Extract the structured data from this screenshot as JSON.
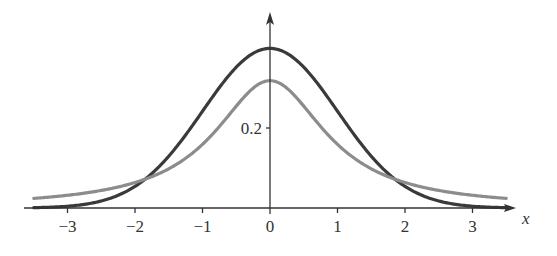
{
  "chart_data": {
    "type": "line",
    "title": "",
    "xlabel": "x",
    "ylabel": "",
    "xlim": [
      -3.5,
      3.5
    ],
    "ylim": [
      0,
      0.42
    ],
    "x_ticks": [
      -3,
      -2,
      -1,
      0,
      1,
      2,
      3
    ],
    "x_tick_labels": [
      "−3",
      "−2",
      "−1",
      "0",
      "1",
      "2",
      "3"
    ],
    "y_ticks": [
      0.2
    ],
    "y_tick_labels": [
      "0.2"
    ],
    "grid": false,
    "legend": null,
    "series": [
      {
        "name": "standard normal density",
        "color": "#3a3a3a",
        "x": [
          -3.5,
          -3,
          -2.5,
          -2,
          -1.5,
          -1,
          -0.5,
          0,
          0.5,
          1,
          1.5,
          2,
          2.5,
          3,
          3.5
        ],
        "values": [
          0.001,
          0.004,
          0.018,
          0.054,
          0.13,
          0.242,
          0.352,
          0.399,
          0.352,
          0.242,
          0.13,
          0.054,
          0.018,
          0.004,
          0.001
        ]
      },
      {
        "name": "heavy-tailed density (t, 1 df)",
        "color": "#8c8c8c",
        "x": [
          -3.5,
          -3,
          -2.5,
          -2,
          -1.5,
          -1,
          -0.5,
          0,
          0.5,
          1,
          1.5,
          2,
          2.5,
          3,
          3.5
        ],
        "values": [
          0.024,
          0.032,
          0.044,
          0.064,
          0.098,
          0.159,
          0.255,
          0.318,
          0.255,
          0.159,
          0.098,
          0.064,
          0.044,
          0.032,
          0.024
        ]
      }
    ]
  },
  "labels": {
    "x_axis": "x",
    "y_tick": "0.2",
    "x_ticks": [
      "−3",
      "−2",
      "−1",
      "0",
      "1",
      "2",
      "3"
    ]
  }
}
